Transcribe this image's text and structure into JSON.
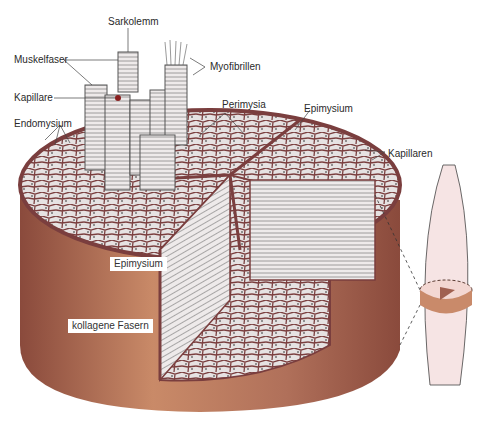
{
  "figure": {
    "type": "anatomical-illustration"
  },
  "labels": {
    "sarkolemm": "Sarkolemm",
    "muskelfaser": "Muskelfaser",
    "myofibrillen": "Myofibrillen",
    "kapillare": "Kapillare",
    "endomysium": "Endomysium",
    "perimysia": "Perimysia",
    "epimysium_top": "Epimysium",
    "kapillaren": "Kapillaren",
    "epimysium_side": "Epimysium",
    "kollagene_fasern": "kollagene Fasern"
  },
  "colors": {
    "epimysium_outer": "#a0604a",
    "epimysium_light": "#c8896a",
    "septa": "#7a3e3e",
    "fiber_fill": "#e8e4e4",
    "inset_muscle": "#f6e4e4",
    "inset_disk": "#c98a6a"
  }
}
